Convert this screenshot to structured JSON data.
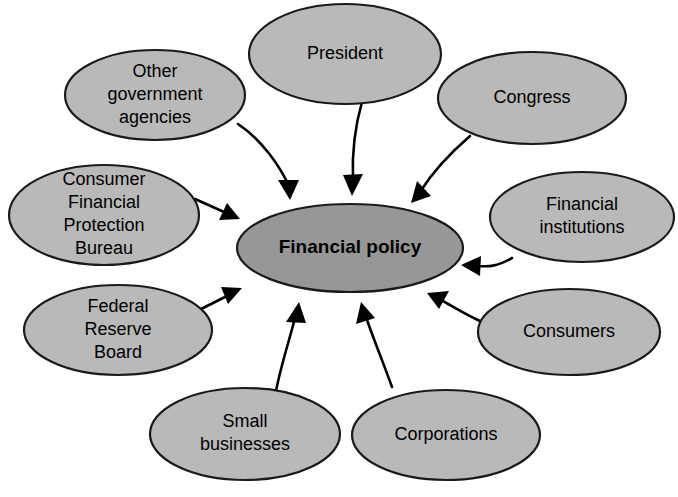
{
  "diagram": {
    "center": {
      "id": "financial-policy",
      "label": "Financial policy",
      "lines": [
        "Financial policy"
      ],
      "cx": 350,
      "cy": 248,
      "rx": 113,
      "ry": 44,
      "fill": "#979797",
      "stroke": "#1a1a1a",
      "bold": true
    },
    "nodes": [
      {
        "id": "other-government-agencies",
        "label": "Other government agencies",
        "lines": [
          "Other",
          "government",
          "agencies"
        ],
        "cx": 155,
        "cy": 95,
        "rx": 90,
        "ry": 45,
        "fill": "#b9b9b9",
        "stroke": "#1a1a1a"
      },
      {
        "id": "president",
        "label": "President",
        "lines": [
          "President"
        ],
        "cx": 345,
        "cy": 54,
        "rx": 96,
        "ry": 50,
        "fill": "#b9b9b9",
        "stroke": "#1a1a1a"
      },
      {
        "id": "congress",
        "label": "Congress",
        "lines": [
          "Congress"
        ],
        "cx": 532,
        "cy": 98,
        "rx": 94,
        "ry": 46,
        "fill": "#b9b9b9",
        "stroke": "#1a1a1a"
      },
      {
        "id": "consumer-financial-protection-bureau",
        "label": "Consumer Financial Protection Bureau",
        "lines": [
          "Consumer",
          "Financial",
          "Protection",
          "Bureau"
        ],
        "cx": 104,
        "cy": 215,
        "rx": 95,
        "ry": 50,
        "fill": "#b9b9b9",
        "stroke": "#1a1a1a"
      },
      {
        "id": "financial-institutions",
        "label": "Financial institutions",
        "lines": [
          "Financial",
          "institutions"
        ],
        "cx": 582,
        "cy": 217,
        "rx": 92,
        "ry": 45,
        "fill": "#b9b9b9",
        "stroke": "#1a1a1a"
      },
      {
        "id": "federal-reserve-board",
        "label": "Federal Reserve Board",
        "lines": [
          "Federal",
          "Reserve",
          "Board"
        ],
        "cx": 118,
        "cy": 330,
        "rx": 94,
        "ry": 45,
        "fill": "#b9b9b9",
        "stroke": "#1a1a1a"
      },
      {
        "id": "consumers",
        "label": "Consumers",
        "lines": [
          "Consumers"
        ],
        "cx": 569,
        "cy": 332,
        "rx": 91,
        "ry": 43,
        "fill": "#b9b9b9",
        "stroke": "#1a1a1a"
      },
      {
        "id": "small-businesses",
        "label": "Small businesses",
        "lines": [
          "Small",
          "businesses"
        ],
        "cx": 245,
        "cy": 434,
        "rx": 95,
        "ry": 46,
        "fill": "#b9b9b9",
        "stroke": "#1a1a1a"
      },
      {
        "id": "corporations",
        "label": "Corporations",
        "lines": [
          "Corporations"
        ],
        "cx": 446,
        "cy": 435,
        "rx": 94,
        "ry": 45,
        "fill": "#b9b9b9",
        "stroke": "#1a1a1a"
      }
    ],
    "edges": [
      {
        "id": "edge-other-government-agencies",
        "from": "other-government-agencies",
        "to": "financial-policy",
        "direction": "to-center",
        "path": "M 238 124 C 262 140, 280 166, 290 188",
        "arrow": "M 290 200 L 278 180 L 299 180 Z"
      },
      {
        "id": "edge-president",
        "from": "president",
        "to": "financial-policy",
        "direction": "to-center",
        "path": "M 362 102 C 354 130, 352 158, 353 180",
        "arrow": "M 352 196 L 343 175 L 363 174 Z"
      },
      {
        "id": "edge-congress",
        "from": "congress",
        "to": "financial-policy",
        "direction": "to-center",
        "path": "M 470 136 C 448 155, 430 176, 420 192",
        "arrow": "M 411 203 L 417 181 L 431 196 Z"
      },
      {
        "id": "edge-consumer-financial-protection-bureau",
        "from": "consumer-financial-protection-bureau",
        "to": "financial-policy",
        "direction": "to-center",
        "path": "M 195 199 L 224 212",
        "arrow": "M 240 219 L 219 220 L 227 203 Z"
      },
      {
        "id": "edge-federal-reserve-board",
        "from": "federal-reserve-board",
        "to": "financial-policy",
        "direction": "to-center",
        "path": "M 197 311 L 227 296",
        "arrow": "M 242 288 L 228 304 L 221 287 Z"
      },
      {
        "id": "edge-financial-institutions",
        "from": "financial-institutions",
        "to": "financial-policy",
        "direction": "to-center",
        "path": "M 512 258 C 498 266, 490 267, 478 266",
        "arrow": "M 461 265 L 481 256 L 480 276 Z"
      },
      {
        "id": "edge-consumers",
        "from": "consumers",
        "to": "financial-policy",
        "direction": "to-center",
        "path": "M 480 321 C 466 315, 452 306, 441 300",
        "arrow": "M 427 293 L 449 291 L 439 309 Z"
      },
      {
        "id": "edge-small-businesses",
        "from": "small-businesses",
        "to": "financial-policy",
        "direction": "to-center",
        "path": "M 276 391 C 281 365, 290 338, 295 318",
        "arrow": "M 299 302 L 306 323 L 286 322 Z"
      },
      {
        "id": "edge-corporations",
        "from": "corporations",
        "to": "financial-policy",
        "direction": "to-center",
        "path": "M 392 387 C 383 362, 372 335, 366 317",
        "arrow": "M 361 302 L 375 318 L 356 324 Z"
      }
    ]
  }
}
